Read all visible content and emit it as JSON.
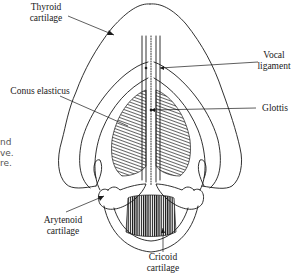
{
  "figure": {
    "labels": {
      "thyroid": [
        "Thyroid",
        "cartilage"
      ],
      "conus": [
        "Conus elasticus"
      ],
      "vocal": [
        "Vocal",
        "ligament"
      ],
      "glottis": [
        "Glottis"
      ],
      "arytenoid": [
        "Arytenoid",
        "cartilage"
      ],
      "cricoid": [
        "Cricoid",
        "cartilage"
      ]
    },
    "edge_text_fragments": [
      "nd",
      "ve.",
      "re."
    ],
    "colors": {
      "ink": "#1a1a1a",
      "edge_text": "#555555",
      "background": "#ffffff"
    }
  }
}
